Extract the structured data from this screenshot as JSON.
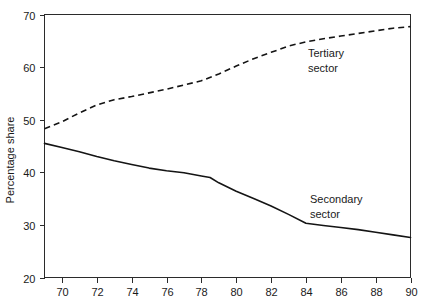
{
  "chart_data": {
    "type": "line",
    "title": "",
    "xlabel": "",
    "ylabel": "Percentage share",
    "xlim": [
      69,
      90
    ],
    "ylim": [
      20,
      70
    ],
    "xticks": [
      70,
      72,
      74,
      76,
      78,
      80,
      82,
      84,
      86,
      88,
      90
    ],
    "xtick_labels": [
      "70",
      "72",
      "74",
      "76",
      "78",
      "80",
      "82",
      "84",
      "86",
      "88",
      "90"
    ],
    "yticks": [
      20,
      30,
      40,
      50,
      60,
      70
    ],
    "ytick_labels": [
      "20",
      "30",
      "40",
      "50",
      "60",
      "70"
    ],
    "grid": false,
    "legend_position": "inline-annotations",
    "series": [
      {
        "name": "Tertiary sector",
        "style": "dashed",
        "color": "#141414",
        "label_line1": "Tertiary",
        "label_line2": "sector",
        "x": [
          69,
          70,
          71,
          72,
          73,
          74,
          75,
          76,
          77,
          78,
          79,
          80,
          81,
          82,
          83,
          84,
          85,
          86,
          87,
          88,
          89,
          90
        ],
        "values": [
          48.3,
          49.6,
          51.3,
          52.8,
          53.8,
          54.4,
          55.1,
          55.8,
          56.6,
          57.4,
          58.7,
          60.2,
          61.6,
          62.8,
          64.0,
          64.8,
          65.4,
          65.9,
          66.4,
          66.9,
          67.4,
          67.7
        ]
      },
      {
        "name": "Secondary sector",
        "style": "solid",
        "color": "#141414",
        "label_line1": "Secondary",
        "label_line2": "sector",
        "x": [
          69,
          70,
          71,
          72,
          73,
          74,
          75,
          76,
          77,
          78,
          78.5,
          79,
          80,
          81,
          82,
          83,
          84,
          85,
          86,
          87,
          88,
          89,
          90
        ],
        "values": [
          45.5,
          44.7,
          43.9,
          43.0,
          42.2,
          41.5,
          40.8,
          40.3,
          39.9,
          39.3,
          39.0,
          38.0,
          36.4,
          35.0,
          33.6,
          32.0,
          30.3,
          29.9,
          29.5,
          29.1,
          28.6,
          28.1,
          27.6
        ]
      }
    ]
  }
}
